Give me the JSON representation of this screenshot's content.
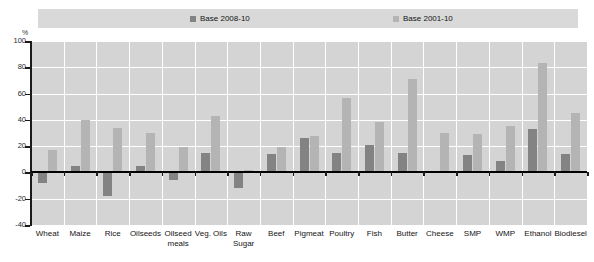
{
  "chart_data": {
    "type": "bar",
    "title": "",
    "subtitle": "",
    "xlabel": "",
    "ylabel": "%",
    "ylim": [
      -40,
      100
    ],
    "ytick_values": [
      100,
      80,
      60,
      40,
      20,
      0,
      -20,
      -40
    ],
    "ytick_labels": [
      "100",
      "80",
      "60",
      "40",
      "20",
      "0",
      "-20",
      "-40"
    ],
    "grid": true,
    "legend_position": "top",
    "categories": [
      "Wheat",
      "Maize",
      "Rice",
      "Oilseeds",
      "Oilseed\nmeals",
      "Veg. Oils",
      "Raw\nSugar",
      "Beef",
      "Pigmeat",
      "Poultry",
      "Fish",
      "Butter",
      "Cheese",
      "SMP",
      "WMP",
      "Ethanol",
      "Biodiesel"
    ],
    "series": [
      {
        "name": "Base 2008-10",
        "color": "#838383",
        "values": [
          -8,
          5,
          -18,
          5,
          -6,
          15,
          -12,
          14,
          26,
          15,
          21,
          15,
          1,
          13,
          9,
          33,
          14
        ]
      },
      {
        "name": "Base 2001-10",
        "color": "#b4b4b4",
        "values": [
          17,
          40,
          34,
          30,
          19,
          43,
          2,
          19,
          28,
          57,
          38,
          71,
          30,
          29,
          35,
          83,
          45
        ]
      }
    ]
  },
  "legend": {
    "items": [
      {
        "label": "Base 2008-10"
      },
      {
        "label": "Base 2001-10"
      }
    ]
  },
  "axes": {
    "y_unit": "%"
  }
}
